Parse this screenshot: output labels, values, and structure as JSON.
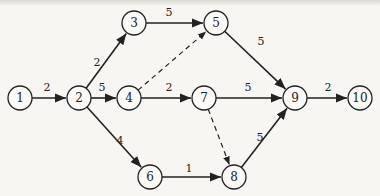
{
  "diagram": {
    "type": "activity-network",
    "nodes": [
      {
        "id": "1",
        "label": "1",
        "x": 20,
        "y": 98
      },
      {
        "id": "2",
        "label": "2",
        "x": 79,
        "y": 98
      },
      {
        "id": "3",
        "label": "3",
        "x": 134,
        "y": 23
      },
      {
        "id": "4",
        "label": "4",
        "x": 129,
        "y": 98
      },
      {
        "id": "5",
        "label": "5",
        "x": 216,
        "y": 23
      },
      {
        "id": "6",
        "label": "6",
        "x": 150,
        "y": 177
      },
      {
        "id": "7",
        "label": "7",
        "x": 204,
        "y": 98
      },
      {
        "id": "8",
        "label": "8",
        "x": 234,
        "y": 177
      },
      {
        "id": "9",
        "label": "9",
        "x": 295,
        "y": 98
      },
      {
        "id": "10",
        "label": "10",
        "x": 360,
        "y": 98
      }
    ],
    "edges": [
      {
        "from": "1",
        "to": "2",
        "weight": "2",
        "dashed": false,
        "lx": 47,
        "ly": 87
      },
      {
        "from": "2",
        "to": "3",
        "weight": "2",
        "dashed": false,
        "lx": 97,
        "ly": 62
      },
      {
        "from": "2",
        "to": "4",
        "weight": "5",
        "dashed": false,
        "lx": 102,
        "ly": 87
      },
      {
        "from": "2",
        "to": "6",
        "weight": "4",
        "dashed": false,
        "lx": 120,
        "ly": 140
      },
      {
        "from": "3",
        "to": "5",
        "weight": "5",
        "dashed": false,
        "lx": 169,
        "ly": 12
      },
      {
        "from": "4",
        "to": "5",
        "weight": "",
        "dashed": true,
        "lx": 0,
        "ly": 0
      },
      {
        "from": "4",
        "to": "7",
        "weight": "2",
        "dashed": false,
        "lx": 169,
        "ly": 87
      },
      {
        "from": "5",
        "to": "9",
        "weight": "5",
        "dashed": false,
        "lx": 261,
        "ly": 41
      },
      {
        "from": "7",
        "to": "9",
        "weight": "5",
        "dashed": false,
        "lx": 248,
        "ly": 87
      },
      {
        "from": "7",
        "to": "8",
        "weight": "",
        "dashed": true,
        "lx": 0,
        "ly": 0
      },
      {
        "from": "6",
        "to": "8",
        "weight": "1",
        "dashed": false,
        "lx": 189,
        "ly": 168
      },
      {
        "from": "8",
        "to": "9",
        "weight": "5",
        "dashed": false,
        "lx": 260,
        "ly": 137
      },
      {
        "from": "9",
        "to": "10",
        "weight": "2",
        "dashed": false,
        "lx": 328,
        "ly": 87
      }
    ],
    "node_radius": 12
  }
}
